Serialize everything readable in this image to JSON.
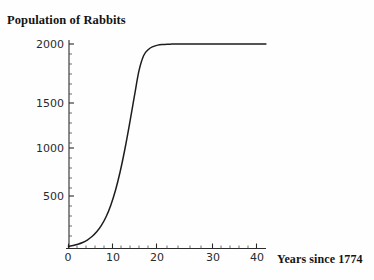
{
  "chart_data": {
    "type": "line",
    "title": "Population of Rabbits",
    "xlabel": "Years since 1774",
    "ylabel": "",
    "xlim": [
      0,
      42
    ],
    "ylim": [
      0,
      2100
    ],
    "grid": false,
    "legend": "none",
    "xticks": [
      0,
      10,
      20,
      30,
      40
    ],
    "xtick_labels": [
      "0",
      "10",
      "20",
      "30",
      "40"
    ],
    "yticks": [
      500,
      1000,
      1500,
      2000
    ],
    "ytick_labels": [
      "500",
      "1000",
      "1500",
      "2000"
    ],
    "curve_label": "logistic growth",
    "model": {
      "carrying_capacity": 2000,
      "growth_rate": 0.35,
      "midpoint_year": 13
    },
    "x": [
      0,
      1,
      2,
      3,
      4,
      5,
      6,
      7,
      8,
      9,
      10,
      11,
      12,
      13,
      14,
      15,
      16,
      17,
      18,
      19,
      20,
      21,
      22,
      23,
      24,
      25,
      26,
      27,
      28,
      29,
      30,
      31,
      32,
      33,
      34,
      35,
      36,
      37,
      38,
      39,
      40,
      41,
      42
    ],
    "values": [
      21,
      30,
      42,
      59,
      83,
      117,
      163,
      226,
      311,
      424,
      570,
      753,
      973,
      1222,
      1485,
      1739,
      1960,
      2000,
      2000,
      2000,
      2000,
      2000,
      2000,
      2000,
      2000,
      2000,
      2000,
      2000,
      2000,
      2000,
      2000,
      2000,
      2000,
      2000,
      2000,
      2000,
      2000,
      2000,
      2000,
      2000,
      2000,
      2000,
      2000
    ],
    "series": [
      {
        "name": "Population of Rabbits",
        "values": [
          21,
          30,
          42,
          59,
          83,
          117,
          163,
          226,
          311,
          424,
          570,
          753,
          973,
          1222,
          1485,
          1739,
          1887,
          1947,
          1975,
          1989,
          1995,
          1998,
          1999,
          2000,
          2000,
          2000,
          2000,
          2000,
          2000,
          2000,
          2000,
          2000,
          2000,
          2000,
          2000,
          2000,
          2000,
          2000,
          2000,
          2000,
          2000,
          2000,
          2000
        ]
      }
    ],
    "colors": {
      "curve": "#1d1d1d",
      "axis": "#2b2b2b",
      "text": "#141414",
      "background": "#fefefe"
    }
  }
}
